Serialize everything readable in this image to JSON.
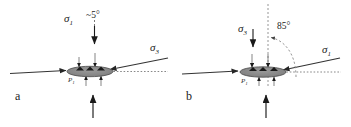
{
  "figure": {
    "type": "stress-orientation-diagram",
    "background": "#ffffff",
    "ink_color": "#262626",
    "ellipse_fill": "#8c8c8c",
    "width": 351,
    "height": 127
  },
  "panels": [
    {
      "id": "a",
      "panel_label": "a",
      "stress_vertical": {
        "symbol": "σ",
        "subscript": "1",
        "label": "σ1",
        "direction": "down",
        "line_style": "dashed"
      },
      "stress_oblique": {
        "symbol": "σ",
        "subscript": "3",
        "label": "σ3",
        "direction": "down-left",
        "line_style": "solid"
      },
      "angle": {
        "value": "~5",
        "unit": "°",
        "text": "~5°"
      },
      "inclusion_label": {
        "symbol": "P",
        "subscript": "1",
        "text": "P1"
      },
      "horizontal_arrow_direction": "right",
      "dotted_reference_line": "horizontal-right"
    },
    {
      "id": "b",
      "panel_label": "b",
      "stress_vertical": {
        "symbol": "σ",
        "subscript": "3",
        "label": "σ3",
        "direction": "down",
        "line_style": "solid"
      },
      "stress_oblique": {
        "symbol": "σ",
        "subscript": "1",
        "label": "σ1",
        "direction": "down-left",
        "line_style": "solid"
      },
      "angle": {
        "value": "85",
        "unit": "°",
        "text": "85°",
        "arc_style": "dashed-curved-arrow"
      },
      "inclusion_label": {
        "symbol": "P",
        "subscript": "1",
        "text": "P1"
      },
      "horizontal_arrow_direction": "right",
      "dotted_reference_line": "horizontal-right"
    }
  ]
}
